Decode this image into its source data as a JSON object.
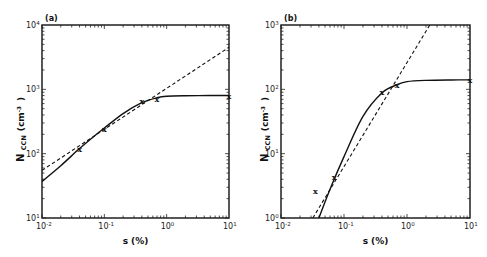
{
  "chart_data": [
    {
      "type": "line",
      "panel_label": "(a)",
      "xlabel": "s (%)",
      "ylabel": "N CCN (cm-3)",
      "ylabel_main": "N",
      "ylabel_sub": "CCN",
      "ylabel_unit": "(cm",
      "ylabel_unit_exp": "-3",
      "ylabel_unit_close": ")",
      "xscale": "log",
      "yscale": "log",
      "xlim": [
        0.01,
        10
      ],
      "ylim": [
        10,
        10000
      ],
      "x_ticks": [
        {
          "base": "10",
          "exp": "-2"
        },
        {
          "base": "10",
          "exp": "-1"
        },
        {
          "base": "10",
          "exp": "0"
        },
        {
          "base": "10",
          "exp": "1"
        }
      ],
      "y_ticks": [
        {
          "base": "10",
          "exp": "1"
        },
        {
          "base": "10",
          "exp": "2"
        },
        {
          "base": "10",
          "exp": "3"
        },
        {
          "base": "10",
          "exp": "4"
        }
      ],
      "grid": false,
      "series": [
        {
          "name": "fit (solid)",
          "style": "solid",
          "x": [
            0.01,
            0.02,
            0.04,
            0.07,
            0.1,
            0.2,
            0.4,
            0.7,
            1.0,
            2.0,
            5.0,
            10.0
          ],
          "y": [
            37,
            65,
            120,
            190,
            250,
            420,
            620,
            740,
            780,
            795,
            800,
            800
          ]
        },
        {
          "name": "power law (dashed)",
          "style": "dashed",
          "x": [
            0.01,
            10.0
          ],
          "y": [
            55,
            4500
          ]
        },
        {
          "name": "measurements",
          "style": "marker-x",
          "x": [
            0.04,
            0.1,
            0.4,
            0.7,
            10.0
          ],
          "y": [
            120,
            240,
            660,
            700,
            800
          ]
        }
      ]
    },
    {
      "type": "line",
      "panel_label": "(b)",
      "xlabel": "s (%)",
      "ylabel": "N CCN (cm-3)",
      "ylabel_main": "N",
      "ylabel_sub": "CCN",
      "ylabel_unit": "(cm",
      "ylabel_unit_exp": "-3",
      "ylabel_unit_close": ")",
      "xscale": "log",
      "yscale": "log",
      "xlim": [
        0.01,
        10
      ],
      "ylim": [
        1,
        1000
      ],
      "x_ticks": [
        {
          "base": "10",
          "exp": "-2"
        },
        {
          "base": "10",
          "exp": "-1"
        },
        {
          "base": "10",
          "exp": "0"
        },
        {
          "base": "10",
          "exp": "1"
        }
      ],
      "y_ticks": [
        {
          "base": "10",
          "exp": "0"
        },
        {
          "base": "10",
          "exp": "1"
        },
        {
          "base": "10",
          "exp": "2"
        },
        {
          "base": "10",
          "exp": "3"
        }
      ],
      "grid": false,
      "series": [
        {
          "name": "fit (solid)",
          "style": "solid",
          "x": [
            0.04,
            0.06,
            0.1,
            0.2,
            0.4,
            0.7,
            1.0,
            2.0,
            5.0,
            10.0
          ],
          "y": [
            1,
            2.8,
            9,
            38,
            88,
            118,
            132,
            138,
            140,
            140
          ]
        },
        {
          "name": "power law (dashed)",
          "style": "dashed",
          "x": [
            0.032,
            2.3
          ],
          "y": [
            1,
            1000
          ]
        },
        {
          "name": "measurements",
          "style": "marker-x",
          "x": [
            0.035,
            0.07,
            0.4,
            0.7,
            10.0
          ],
          "y": [
            2.6,
            4.3,
            90,
            118,
            140
          ]
        }
      ]
    }
  ]
}
